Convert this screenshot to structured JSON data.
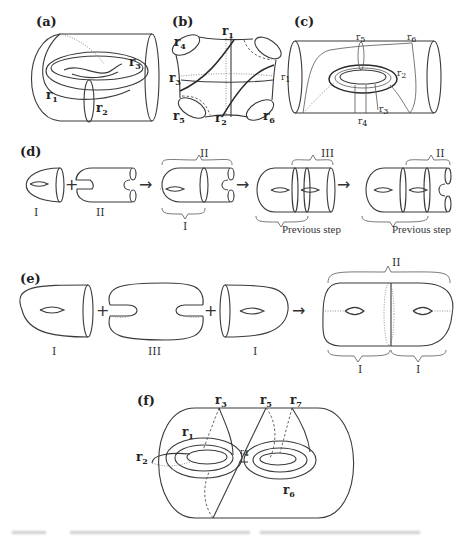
{
  "figure": {
    "panels": {
      "a": {
        "label": "(a)",
        "curves": [
          {
            "name": "r",
            "sub": "1"
          },
          {
            "name": "r",
            "sub": "2"
          },
          {
            "name": "r",
            "sub": "3"
          }
        ]
      },
      "b": {
        "label": "(b)",
        "curves": [
          {
            "name": "r",
            "sub": "1"
          },
          {
            "name": "r",
            "sub": "2"
          },
          {
            "name": "r",
            "sub": "3"
          },
          {
            "name": "r",
            "sub": "4"
          },
          {
            "name": "r",
            "sub": "5"
          },
          {
            "name": "r",
            "sub": "6"
          }
        ]
      },
      "c": {
        "label": "(c)",
        "curves": [
          {
            "name": "r",
            "sub": "1"
          },
          {
            "name": "r",
            "sub": "2"
          },
          {
            "name": "r",
            "sub": "3"
          },
          {
            "name": "r",
            "sub": "4"
          },
          {
            "name": "r",
            "sub": "5"
          },
          {
            "name": "r",
            "sub": "6"
          }
        ]
      },
      "d": {
        "label": "(d)",
        "piece_labels": [
          "I",
          "II"
        ],
        "plus": "+",
        "arrow": "→",
        "brace_top_1": "II",
        "brace_bottom_1": "I",
        "brace_top_2": "III",
        "brace_top_3": "II",
        "previous_step_1": "Previous step",
        "previous_step_2": "Previous step"
      },
      "e": {
        "label": "(e)",
        "piece_labels": [
          "I",
          "III",
          "I"
        ],
        "plus": "+",
        "arrow": "→",
        "brace_top": "II",
        "brace_bottom_left": "I",
        "brace_bottom_right": "I"
      },
      "f": {
        "label": "(f)",
        "curves": [
          {
            "name": "r",
            "sub": "1"
          },
          {
            "name": "r",
            "sub": "2"
          },
          {
            "name": "r",
            "sub": "3"
          },
          {
            "name": "r",
            "sub": "4"
          },
          {
            "name": "r",
            "sub": "5"
          },
          {
            "name": "r",
            "sub": "6"
          },
          {
            "name": "r",
            "sub": "7"
          }
        ]
      }
    },
    "caption": {
      "text": ""
    }
  }
}
